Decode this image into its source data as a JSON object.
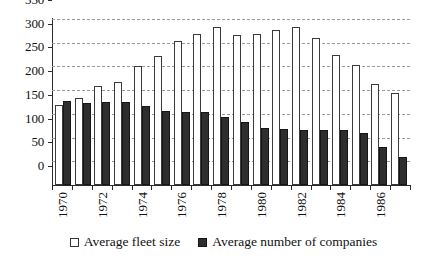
{
  "chart_data": {
    "type": "bar",
    "title": "",
    "xlabel": "",
    "ylabel": "",
    "ylim": [
      0,
      350
    ],
    "ytick_step": 50,
    "yticks": [
      0,
      50,
      100,
      150,
      200,
      250,
      300,
      350
    ],
    "grid": true,
    "legend_position": "bottom",
    "categories": [
      1970,
      1971,
      1972,
      1973,
      1974,
      1975,
      1976,
      1977,
      1978,
      1979,
      1980,
      1981,
      1982,
      1983,
      1984,
      1985,
      1986,
      1987
    ],
    "visible_tick_labels": [
      "1970",
      "1972",
      "1974",
      "1976",
      "1978",
      "1980",
      "1982",
      "1984",
      "1986"
    ],
    "visible_tick_indices": [
      0,
      2,
      4,
      6,
      8,
      10,
      12,
      14,
      16
    ],
    "series": [
      {
        "name": "Average fleet size",
        "color": "#ffffff",
        "edge_color": "#3a3a3a",
        "values": [
          168,
          184,
          209,
          218,
          250,
          273,
          304,
          318,
          333,
          316,
          318,
          326,
          334,
          309,
          274,
          253,
          213,
          195
        ]
      },
      {
        "name": "Average number of companies",
        "color": "#2e2e2e",
        "edge_color": "#161616",
        "values": [
          178,
          172,
          176,
          174,
          166,
          157,
          155,
          155,
          143,
          132,
          120,
          118,
          116,
          116,
          117,
          110,
          81,
          60
        ]
      }
    ]
  },
  "legend": {
    "items": [
      {
        "label": "Average fleet size",
        "marker": "white-square-icon"
      },
      {
        "label": "Average number of companies",
        "marker": "black-square-icon"
      }
    ]
  },
  "colors": {
    "axis": "#2a2a2a",
    "grid": "#9a9a9a",
    "text": "#111111",
    "background": "#ffffff"
  }
}
